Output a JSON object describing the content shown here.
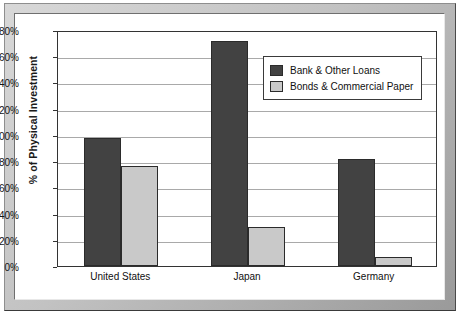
{
  "chart_data": {
    "type": "bar",
    "title": "",
    "xlabel": "",
    "ylabel": "% of Physical Investment",
    "categories": [
      "United States",
      "Japan",
      "Germany"
    ],
    "series": [
      {
        "name": "Bank & Other Loans",
        "values": [
          98,
          172,
          82
        ],
        "color": "#424242"
      },
      {
        "name": "Bonds & Commercial Paper",
        "values": [
          76,
          30,
          7
        ],
        "color": "#c9c9c9"
      }
    ],
    "ylim": [
      0,
      180
    ],
    "ytick_step": 20,
    "ytick_labels": [
      "180%",
      "160%",
      "140%",
      "120%",
      "100%",
      "80%",
      "60%",
      "40%",
      "20%",
      "0%"
    ],
    "ytick_values": [
      180,
      160,
      140,
      120,
      100,
      80,
      60,
      40,
      20,
      0
    ],
    "grid": true,
    "legend_position": "upper-right"
  },
  "legend": {
    "items": [
      {
        "label": "Bank & Other Loans"
      },
      {
        "label": "Bonds & Commercial Paper"
      }
    ]
  },
  "axis": {
    "y_title": "% of Physical Investment"
  }
}
